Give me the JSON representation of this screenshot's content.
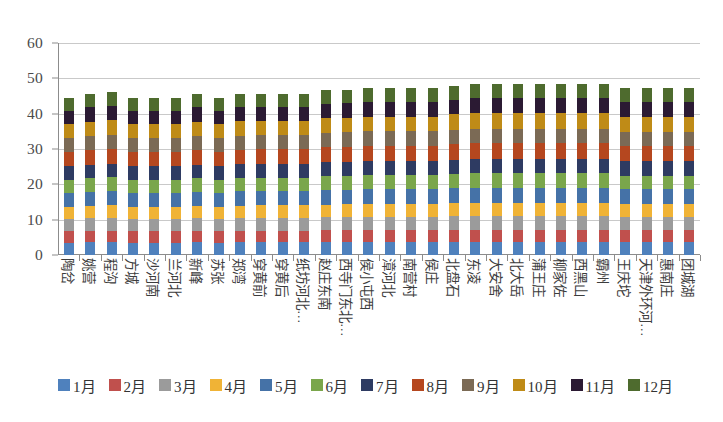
{
  "chart_data": {
    "type": "bar",
    "stacked": true,
    "title": "",
    "xlabel": "",
    "ylabel": "",
    "ylim": [
      0,
      60
    ],
    "yticks": [
      0,
      10,
      20,
      30,
      40,
      50,
      60
    ],
    "grid": true,
    "legend_position": "bottom",
    "categories": [
      "陶岔",
      "姚营",
      "程沟",
      "方城",
      "沙河南",
      "兰河北",
      "新峰",
      "苏张",
      "郑湾",
      "穿黄前",
      "穿黄后",
      "纸坊河北…",
      "赵庄东南",
      "西寺门东北…",
      "侯小屯西",
      "漳河北",
      "南营村",
      "侯庄",
      "北盘石",
      "东凌",
      "大安舍",
      "北大岳",
      "蒲王庄",
      "柳家佐",
      "西黑山",
      "霸州",
      "王庆坨",
      "天津外环河…",
      "惠南庄",
      "团城湖"
    ],
    "series": [
      {
        "name": "1月",
        "color": "#4f81bd",
        "values": [
          3.5,
          3.6,
          3.6,
          3.5,
          3.5,
          3.5,
          3.6,
          3.5,
          3.6,
          3.6,
          3.6,
          3.6,
          3.7,
          3.7,
          3.7,
          3.7,
          3.7,
          3.7,
          3.8,
          3.8,
          3.8,
          3.8,
          3.8,
          3.8,
          3.8,
          3.8,
          3.7,
          3.7,
          3.7,
          3.7
        ]
      },
      {
        "name": "2月",
        "color": "#c0504d",
        "values": [
          3.2,
          3.2,
          3.3,
          3.2,
          3.2,
          3.2,
          3.2,
          3.2,
          3.2,
          3.3,
          3.3,
          3.3,
          3.3,
          3.3,
          3.4,
          3.4,
          3.4,
          3.4,
          3.4,
          3.4,
          3.4,
          3.4,
          3.4,
          3.4,
          3.4,
          3.4,
          3.3,
          3.3,
          3.3,
          3.3
        ]
      },
      {
        "name": "3月",
        "color": "#9b9b9b",
        "values": [
          3.6,
          3.6,
          3.7,
          3.6,
          3.6,
          3.6,
          3.6,
          3.6,
          3.7,
          3.7,
          3.7,
          3.7,
          3.7,
          3.8,
          3.8,
          3.8,
          3.8,
          3.8,
          3.8,
          3.9,
          3.9,
          3.9,
          3.9,
          3.9,
          3.9,
          3.9,
          3.8,
          3.8,
          3.8,
          3.8
        ]
      },
      {
        "name": "4月",
        "color": "#f0b336",
        "values": [
          3.4,
          3.5,
          3.5,
          3.4,
          3.4,
          3.4,
          3.5,
          3.4,
          3.5,
          3.5,
          3.5,
          3.5,
          3.6,
          3.6,
          3.6,
          3.6,
          3.6,
          3.6,
          3.7,
          3.7,
          3.7,
          3.7,
          3.7,
          3.7,
          3.7,
          3.7,
          3.6,
          3.6,
          3.6,
          3.6
        ]
      },
      {
        "name": "5月",
        "color": "#4572a7",
        "values": [
          3.9,
          4.0,
          4.1,
          3.9,
          3.9,
          3.9,
          4.0,
          3.9,
          4.0,
          4.0,
          4.0,
          4.0,
          4.1,
          4.1,
          4.2,
          4.2,
          4.2,
          4.2,
          4.2,
          4.3,
          4.3,
          4.3,
          4.3,
          4.3,
          4.3,
          4.3,
          4.2,
          4.2,
          4.2,
          4.2
        ]
      },
      {
        "name": "6月",
        "color": "#7aa64b",
        "values": [
          3.7,
          3.8,
          3.8,
          3.7,
          3.7,
          3.7,
          3.8,
          3.7,
          3.8,
          3.8,
          3.8,
          3.8,
          3.9,
          3.9,
          3.9,
          3.9,
          3.9,
          3.9,
          4.0,
          4.0,
          4.0,
          4.0,
          4.0,
          4.0,
          4.0,
          4.0,
          3.9,
          3.9,
          3.9,
          3.9
        ]
      },
      {
        "name": "7月",
        "color": "#2e3b62",
        "values": [
          3.8,
          3.9,
          3.9,
          3.8,
          3.8,
          3.8,
          3.9,
          3.8,
          3.9,
          3.9,
          3.9,
          3.9,
          4.0,
          4.0,
          4.0,
          4.0,
          4.0,
          4.0,
          4.1,
          4.1,
          4.1,
          4.1,
          4.1,
          4.1,
          4.1,
          4.1,
          4.0,
          4.0,
          4.0,
          4.0
        ]
      },
      {
        "name": "8月",
        "color": "#b5471f",
        "values": [
          4.0,
          4.1,
          4.2,
          4.0,
          4.0,
          4.0,
          4.1,
          4.0,
          4.1,
          4.1,
          4.1,
          4.1,
          4.2,
          4.2,
          4.3,
          4.3,
          4.3,
          4.3,
          4.3,
          4.4,
          4.4,
          4.4,
          4.4,
          4.4,
          4.4,
          4.4,
          4.3,
          4.3,
          4.3,
          4.3
        ]
      },
      {
        "name": "9月",
        "color": "#7b6a55",
        "values": [
          3.9,
          4.0,
          4.0,
          3.9,
          3.9,
          3.9,
          4.0,
          3.9,
          4.0,
          4.0,
          4.0,
          4.0,
          4.1,
          4.1,
          4.1,
          4.1,
          4.1,
          4.1,
          4.2,
          4.2,
          4.2,
          4.2,
          4.2,
          4.2,
          4.2,
          4.2,
          4.1,
          4.1,
          4.1,
          4.1
        ]
      },
      {
        "name": "10月",
        "color": "#bf8b17",
        "values": [
          4.0,
          4.1,
          4.1,
          4.0,
          4.0,
          4.0,
          4.1,
          4.0,
          4.1,
          4.1,
          4.1,
          4.1,
          4.2,
          4.2,
          4.2,
          4.2,
          4.2,
          4.2,
          4.3,
          4.3,
          4.3,
          4.3,
          4.3,
          4.3,
          4.3,
          4.3,
          4.2,
          4.2,
          4.2,
          4.2
        ]
      },
      {
        "name": "11月",
        "color": "#2b1a33",
        "values": [
          3.9,
          4.0,
          4.1,
          3.9,
          3.9,
          3.9,
          4.0,
          3.9,
          4.0,
          4.0,
          4.0,
          4.0,
          4.1,
          4.1,
          4.2,
          4.2,
          4.2,
          4.2,
          4.2,
          4.3,
          4.3,
          4.3,
          4.3,
          4.3,
          4.3,
          4.3,
          4.2,
          4.2,
          4.2,
          4.2
        ]
      },
      {
        "name": "12月",
        "color": "#4e6b2e",
        "values": [
          3.6,
          3.7,
          3.8,
          3.6,
          3.6,
          3.6,
          3.7,
          3.6,
          3.7,
          3.7,
          3.7,
          3.7,
          3.8,
          3.8,
          3.9,
          3.9,
          3.9,
          3.9,
          3.9,
          4.0,
          4.0,
          4.0,
          4.0,
          4.0,
          4.0,
          4.0,
          3.9,
          3.9,
          3.9,
          3.9
        ]
      }
    ],
    "totals": [
      44.5,
      45.5,
      46.1,
      44.5,
      44.5,
      44.5,
      45.5,
      44.5,
      45.6,
      45.7,
      45.7,
      45.7,
      46.7,
      46.8,
      47.3,
      47.3,
      47.3,
      47.3,
      47.5,
      48.4,
      48.4,
      48.4,
      48.4,
      48.4,
      48.4,
      48.4,
      47.2,
      47.2,
      47.2,
      47.2
    ]
  }
}
